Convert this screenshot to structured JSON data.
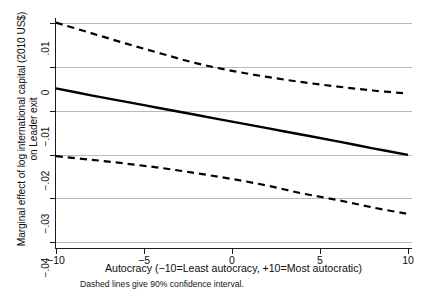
{
  "chart_data": {
    "type": "line",
    "title": "",
    "xlabel": "Autocracy (−10=Least autocracy, +10=Most autocratic)",
    "ylabel_line1": "Marginal effect of log international capital (2010 US$)",
    "ylabel_line2": "on Leader exit",
    "note": "Dashed lines give 90% confidence interval.",
    "xlim": [
      -10,
      10
    ],
    "ylim": [
      -0.04,
      0.01
    ],
    "xticks": [
      -10,
      -5,
      0,
      5,
      10
    ],
    "xticklabels": [
      "−10",
      "−5",
      "0",
      "5",
      "10"
    ],
    "yticks": [
      0.01,
      0,
      -0.01,
      -0.02,
      -0.03,
      -0.04
    ],
    "yticklabels": [
      ".01",
      "0",
      "−.01",
      "−.02",
      "−.03",
      "−.04"
    ],
    "grid": "horizontal",
    "legend": "none",
    "series": [
      {
        "name": "Marginal effect (point estimate)",
        "style": "solid",
        "color": "#000000",
        "x": [
          -10,
          -8,
          -6,
          -4,
          -2,
          0,
          2,
          4,
          6,
          8,
          10
        ],
        "values": [
          -0.0048,
          -0.0064,
          -0.0079,
          -0.0094,
          -0.0109,
          -0.0124,
          -0.0139,
          -0.0154,
          -0.0169,
          -0.0185,
          -0.02
        ]
      },
      {
        "name": "Upper 90% confidence bound",
        "style": "dashed",
        "color": "#000000",
        "x": [
          -10,
          -8,
          -6,
          -4,
          -2,
          0,
          2,
          4,
          6,
          8,
          10
        ],
        "values": [
          0.0102,
          0.0078,
          0.0054,
          0.0031,
          0.0009,
          -0.0008,
          -0.0022,
          -0.0034,
          -0.0044,
          -0.0053,
          -0.006
        ]
      },
      {
        "name": "Lower 90% confidence bound",
        "style": "dashed",
        "color": "#000000",
        "x": [
          -10,
          -8,
          -6,
          -4,
          -2,
          0,
          2,
          4,
          6,
          8,
          10
        ],
        "values": [
          -0.0203,
          -0.0211,
          -0.022,
          -0.023,
          -0.0242,
          -0.0255,
          -0.027,
          -0.0288,
          -0.0303,
          -0.032,
          -0.0335
        ]
      }
    ],
    "zero_crossing_upper_bound_x": -0.8,
    "axis_color": "#1a1a1a",
    "grid_color": "#b8b8b8"
  }
}
